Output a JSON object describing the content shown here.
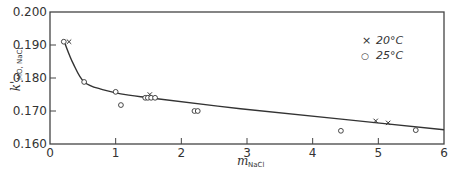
{
  "chart_data": {
    "type": "scatter",
    "title": "",
    "xlabel": "m_NaCl",
    "ylabel": "k'_MO,NaCl",
    "xlim": [
      0,
      6
    ],
    "ylim": [
      0.16,
      0.2
    ],
    "grid": false,
    "legend_position": "upper right",
    "x_ticks": [
      "0",
      "1",
      "2",
      "3",
      "4",
      "5",
      "6"
    ],
    "y_ticks": [
      "0.160",
      "0.170",
      "0.180",
      "0.190",
      "0.200"
    ],
    "series": [
      {
        "name": "20°C",
        "marker": "x",
        "points": [
          {
            "x": 0.29,
            "y": 0.191
          },
          {
            "x": 1.52,
            "y": 0.175
          },
          {
            "x": 4.96,
            "y": 0.167
          },
          {
            "x": 5.15,
            "y": 0.1664
          }
        ]
      },
      {
        "name": "25°C",
        "marker": "circle",
        "points": [
          {
            "x": 0.21,
            "y": 0.191
          },
          {
            "x": 0.52,
            "y": 0.1788
          },
          {
            "x": 1.0,
            "y": 0.1758
          },
          {
            "x": 1.08,
            "y": 0.1718
          },
          {
            "x": 1.45,
            "y": 0.174
          },
          {
            "x": 1.49,
            "y": 0.174
          },
          {
            "x": 1.54,
            "y": 0.174
          },
          {
            "x": 1.6,
            "y": 0.174
          },
          {
            "x": 2.2,
            "y": 0.17
          },
          {
            "x": 2.25,
            "y": 0.17
          },
          {
            "x": 4.43,
            "y": 0.164
          },
          {
            "x": 5.57,
            "y": 0.1642
          }
        ]
      }
    ],
    "fit_curve": {
      "name": "fitted curve",
      "points": [
        {
          "x": 0.23,
          "y": 0.1903
        },
        {
          "x": 0.35,
          "y": 0.1845
        },
        {
          "x": 0.52,
          "y": 0.1788
        },
        {
          "x": 0.8,
          "y": 0.1765
        },
        {
          "x": 1.2,
          "y": 0.1748
        },
        {
          "x": 1.6,
          "y": 0.1738
        },
        {
          "x": 2.9,
          "y": 0.1707
        },
        {
          "x": 4.4,
          "y": 0.1676
        },
        {
          "x": 6.0,
          "y": 0.1643
        }
      ]
    }
  },
  "legend": {
    "items": [
      {
        "symbol": "×",
        "label": "20°C"
      },
      {
        "symbol": "○",
        "label": "25°C"
      }
    ]
  },
  "axes": {
    "y_title_main": "k'",
    "y_title_sub": "MO, NaCl",
    "x_title_main": "m",
    "x_title_sub": "NaCl"
  }
}
